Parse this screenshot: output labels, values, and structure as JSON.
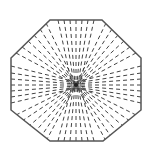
{
  "diagram": {
    "shape": "octagon",
    "center": [
      76,
      85
    ],
    "vertices": [
      [
        50,
        20
      ],
      [
        102,
        20
      ],
      [
        141,
        58
      ],
      [
        141,
        110
      ],
      [
        103,
        141
      ],
      [
        50,
        141
      ],
      [
        11,
        110
      ],
      [
        11,
        58
      ]
    ],
    "stroke_color": "#555555",
    "dash_color": "#444444",
    "background": "#ffffff"
  }
}
